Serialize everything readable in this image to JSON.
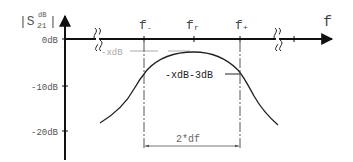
{
  "diagram": {
    "y_axis": {
      "label_main": "|S",
      "label_sub": "21",
      "label_sup": "dB",
      "label_end": "|",
      "ticks": [
        "0dB",
        "-10dB",
        "-20dB"
      ]
    },
    "x_axis": {
      "label": "f",
      "ticks": [
        "f-",
        "fr",
        "f+"
      ],
      "tick_main": [
        "f",
        "f",
        "f"
      ],
      "tick_sub": [
        "-",
        "r",
        "+"
      ]
    },
    "annotations": {
      "peak_level": "-xdB",
      "cutoff_level": "-xdB-3dB",
      "bandwidth": "2*df"
    },
    "colors": {
      "line": "#222222",
      "gray": "#aaaaaa",
      "text": "#333333"
    }
  }
}
